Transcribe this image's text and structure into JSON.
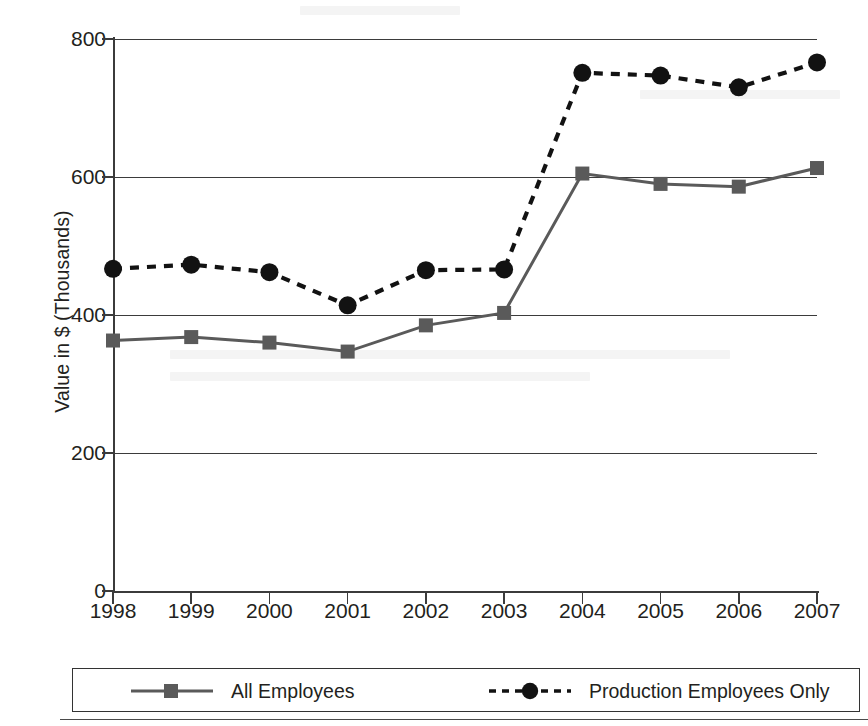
{
  "chart_data": {
    "type": "line",
    "title": "",
    "xlabel": "",
    "ylabel": "Value in $ (Thousands)",
    "categories": [
      "1998",
      "1999",
      "2000",
      "2001",
      "2002",
      "2003",
      "2004",
      "2005",
      "2006",
      "2007"
    ],
    "ylim": [
      0,
      800
    ],
    "yticks": [
      0,
      200,
      400,
      600,
      800
    ],
    "ytick_labels": [
      "0",
      "200",
      "400",
      "600",
      "800"
    ],
    "grid": "horizontal",
    "legend_position": "bottom",
    "series": [
      {
        "name": "All Employees",
        "marker": "square",
        "line_style": "solid",
        "color": "#5a5a5a",
        "values": [
          363,
          368,
          360,
          347,
          385,
          403,
          605,
          590,
          586,
          613
        ]
      },
      {
        "name": "Production Employees Only",
        "marker": "circle",
        "line_style": "dashed",
        "color": "#121212",
        "values": [
          467,
          473,
          462,
          414,
          465,
          466,
          751,
          747,
          730,
          766
        ]
      }
    ]
  },
  "legend": {
    "entries": [
      {
        "label": "All Employees"
      },
      {
        "label": "Production Employees Only"
      }
    ]
  },
  "colors": {
    "all_employees": "#5a5a5a",
    "production_employees": "#121212",
    "axis": "#3b3b3b",
    "text": "#231f20",
    "background": "#ffffff"
  }
}
